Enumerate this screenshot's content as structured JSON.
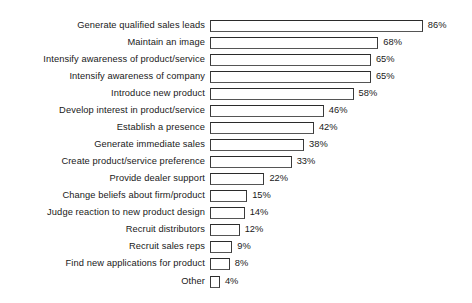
{
  "chart_data": {
    "type": "bar",
    "orientation": "horizontal",
    "title": "",
    "subtitle": "",
    "xlabel": "",
    "ylabel": "",
    "xlim": [
      0,
      100
    ],
    "grid": false,
    "legend": null,
    "value_suffix": "%",
    "categories": [
      "Generate qualified sales leads",
      "Maintain an image",
      "Intensify awareness of product/service",
      "Intensify awareness of company",
      "Introduce new product",
      "Develop interest in product/service",
      "Establish a presence",
      "Generate immediate sales",
      "Create product/service preference",
      "Provide dealer support",
      "Change beliefs about firm/product",
      "Judge reaction to new product design",
      "Recruit distributors",
      "Recruit sales reps",
      "Find new applications for product",
      "Other"
    ],
    "values": [
      86,
      68,
      65,
      65,
      58,
      46,
      42,
      38,
      33,
      22,
      15,
      14,
      12,
      9,
      8,
      4
    ],
    "data_labels": [
      "86%",
      "68%",
      "65%",
      "65%",
      "58%",
      "46%",
      "42%",
      "38%",
      "33%",
      "22%",
      "15%",
      "14%",
      "12%",
      "9%",
      "8%",
      "4%"
    ],
    "colors": {
      "bar_fill": "#ffffff",
      "bar_border": "#3a3a3a",
      "text": "#191919",
      "background": "#ffffff"
    }
  }
}
